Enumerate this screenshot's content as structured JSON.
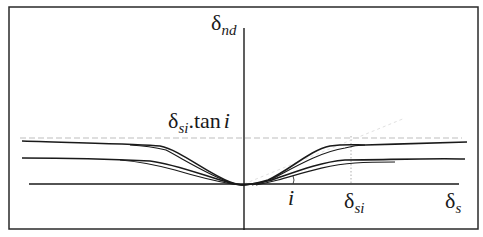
{
  "diagram": {
    "type": "normal-dilation-vs-shear-displacement",
    "y_axis_label": {
      "symbol": "δ",
      "subscript": "nd"
    },
    "x_axis_label": {
      "symbol": "δ",
      "subscript": "s"
    },
    "plateau_label": {
      "symbol": "δ",
      "subscript": "si",
      "suffix": ".tan",
      "suffix_italic": "i"
    },
    "angle_label": "i",
    "peak_displacement_label": {
      "symbol": "δ",
      "subscript": "si"
    },
    "curves": {
      "upper_family_count": 2,
      "lower_family_count": 2,
      "symmetric_about_origin": true
    },
    "colors": {
      "line": "#1a1a1a",
      "frame": "#2a2a2a",
      "dashed": "#bbbbbb",
      "background": "#ffffff"
    }
  }
}
